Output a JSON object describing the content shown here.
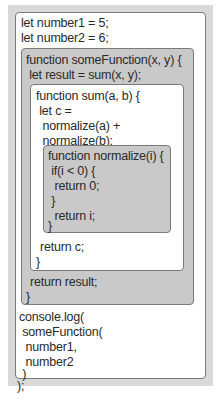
{
  "global": {
    "lines": [
      "let number1 = 5;",
      "let number2 = 6;"
    ]
  },
  "someFunction": {
    "header": [
      "function someFunction(x, y) {",
      " let result = sum(x, y);"
    ],
    "footer": [
      "return result;",
      "}"
    ]
  },
  "sum": {
    "header": [
      "function sum(a, b) {",
      " let c =",
      "  normalize(a) +",
      "  normalize(b);"
    ],
    "footer": [
      "return c;",
      "}"
    ]
  },
  "normalize": {
    "lines": [
      "function normalize(i) {",
      " if(i < 0) {",
      "  return 0;",
      " }",
      "  return i;",
      "}"
    ]
  },
  "console": {
    "lines": [
      "console.log(",
      " someFunction(",
      "  number1,",
      "  number2",
      " )",
      ");"
    ]
  },
  "colors": {
    "frame": "#d9d9d9",
    "white_scope": "#ffffff",
    "gray_scope": "#c9c9c9",
    "border": "#7a7a7a"
  }
}
